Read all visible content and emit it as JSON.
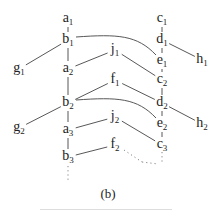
{
  "caption": "(b)",
  "nodes": [
    {
      "id": "a1",
      "base": "a",
      "sub": "1",
      "x": 68,
      "y": 19
    },
    {
      "id": "b1",
      "base": "b",
      "sub": "1",
      "x": 68,
      "y": 40
    },
    {
      "id": "g1",
      "base": "g",
      "sub": "1",
      "x": 19,
      "y": 69
    },
    {
      "id": "a2",
      "base": "a",
      "sub": "2",
      "x": 68,
      "y": 69
    },
    {
      "id": "j1",
      "base": "j",
      "sub": "1",
      "x": 115,
      "y": 50
    },
    {
      "id": "f1",
      "base": "f",
      "sub": "1",
      "x": 115,
      "y": 80
    },
    {
      "id": "b2",
      "base": "b",
      "sub": "2",
      "x": 68,
      "y": 103
    },
    {
      "id": "g2",
      "base": "g",
      "sub": "2",
      "x": 19,
      "y": 128
    },
    {
      "id": "a3",
      "base": "a",
      "sub": "3",
      "x": 68,
      "y": 130
    },
    {
      "id": "j2",
      "base": "j",
      "sub": "2",
      "x": 115,
      "y": 117
    },
    {
      "id": "f2",
      "base": "f",
      "sub": "2",
      "x": 115,
      "y": 145
    },
    {
      "id": "b3",
      "base": "b",
      "sub": "3",
      "x": 68,
      "y": 157
    },
    {
      "id": "c1",
      "base": "c",
      "sub": "1",
      "x": 162,
      "y": 19
    },
    {
      "id": "d1",
      "base": "d",
      "sub": "1",
      "x": 162,
      "y": 40
    },
    {
      "id": "h1",
      "base": "h",
      "sub": "1",
      "x": 202,
      "y": 60
    },
    {
      "id": "e1",
      "base": "e",
      "sub": "1",
      "x": 162,
      "y": 61
    },
    {
      "id": "c2",
      "base": "c",
      "sub": "2",
      "x": 162,
      "y": 80
    },
    {
      "id": "d2",
      "base": "d",
      "sub": "2",
      "x": 162,
      "y": 103
    },
    {
      "id": "h2",
      "base": "h",
      "sub": "2",
      "x": 202,
      "y": 124
    },
    {
      "id": "e2",
      "base": "e",
      "sub": "2",
      "x": 162,
      "y": 124
    },
    {
      "id": "c3",
      "base": "c",
      "sub": "3",
      "x": 162,
      "y": 145
    }
  ],
  "edges": [
    [
      "a1",
      "b1"
    ],
    [
      "b1",
      "a2"
    ],
    [
      "b1",
      "g1"
    ],
    [
      "a2",
      "j1"
    ],
    [
      "j1",
      "c2"
    ],
    [
      "c1",
      "d1"
    ],
    [
      "d1",
      "e1"
    ],
    [
      "e1",
      "c2"
    ],
    [
      "d1",
      "h1"
    ],
    [
      "c2",
      "d2"
    ],
    [
      "a2",
      "b2"
    ],
    [
      "b2",
      "f1"
    ],
    [
      "f1",
      "d2"
    ],
    [
      "b2",
      "g2"
    ],
    [
      "b2",
      "a3"
    ],
    [
      "a3",
      "j2"
    ],
    [
      "j2",
      "c3"
    ],
    [
      "d2",
      "e2"
    ],
    [
      "e2",
      "c3"
    ],
    [
      "d2",
      "h2"
    ],
    [
      "a3",
      "b3"
    ],
    [
      "b3",
      "f2"
    ]
  ],
  "curved_edges": [
    [
      "b1",
      "e1"
    ],
    [
      "b2",
      "e2"
    ]
  ],
  "dotted_edges": [
    [
      "b3",
      "down"
    ],
    [
      "c3",
      "down"
    ],
    [
      "f2",
      "dots"
    ]
  ]
}
